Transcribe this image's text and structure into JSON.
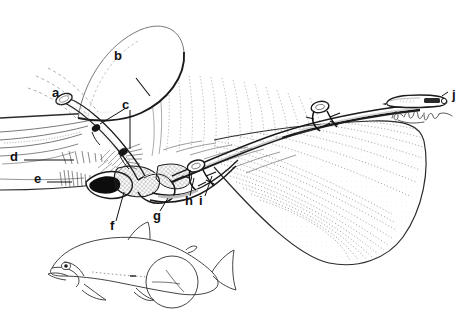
{
  "figure": {
    "style": "pen-and-ink line drawing, black on white",
    "background_color": "#ffffff",
    "ink_color": "#111111",
    "width": 468,
    "height": 320
  },
  "labels": [
    {
      "key": "a",
      "text": "a",
      "x": 52,
      "y": 86,
      "points_to": "cannula-tube-opening"
    },
    {
      "key": "b",
      "text": "b",
      "x": 114,
      "y": 49,
      "points_to": "operculum-gill-cover-flap"
    },
    {
      "key": "c",
      "text": "c",
      "x": 122,
      "y": 98,
      "points_to": "suture-attachment-points"
    },
    {
      "key": "d",
      "text": "d",
      "x": 10,
      "y": 150,
      "points_to": "gill-filament-arch"
    },
    {
      "key": "e",
      "text": "e",
      "x": 34,
      "y": 172,
      "points_to": "gill-raker-row"
    },
    {
      "key": "f",
      "text": "f",
      "x": 110,
      "y": 219,
      "points_to": "afferent-branchial-vessel"
    },
    {
      "key": "g",
      "text": "g",
      "x": 153,
      "y": 209,
      "points_to": "cannula-loop-sleeve"
    },
    {
      "key": "h",
      "text": "h",
      "x": 185,
      "y": 194,
      "points_to": "tether-anchor-knot"
    },
    {
      "key": "i",
      "text": "i",
      "x": 199,
      "y": 194,
      "points_to": "suture-tie-off"
    },
    {
      "key": "j",
      "text": "j",
      "x": 452,
      "y": 88,
      "points_to": "transmitter-capsule-tag"
    }
  ],
  "inset": {
    "name": "whole-fish-silhouette",
    "description": "salmonid fish outline in left profile with circle marking the magnified gill region"
  },
  "annotation": {
    "signature": "illegible handwritten signature beneath the transmitter capsule"
  }
}
